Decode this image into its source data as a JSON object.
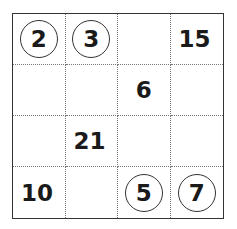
{
  "puzzle": {
    "rows": 4,
    "cols": 4,
    "cells": [
      [
        {
          "value": "2",
          "circled": true
        },
        {
          "value": "3",
          "circled": true
        },
        {
          "value": "",
          "circled": false
        },
        {
          "value": "15",
          "circled": false
        }
      ],
      [
        {
          "value": "",
          "circled": false
        },
        {
          "value": "",
          "circled": false
        },
        {
          "value": "6",
          "circled": false
        },
        {
          "value": "",
          "circled": false
        }
      ],
      [
        {
          "value": "",
          "circled": false
        },
        {
          "value": "21",
          "circled": false
        },
        {
          "value": "",
          "circled": false
        },
        {
          "value": "",
          "circled": false
        }
      ],
      [
        {
          "value": "10",
          "circled": false
        },
        {
          "value": "",
          "circled": false
        },
        {
          "value": "5",
          "circled": true
        },
        {
          "value": "7",
          "circled": true
        }
      ]
    ]
  }
}
